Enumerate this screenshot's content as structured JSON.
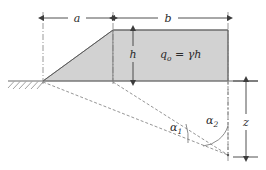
{
  "figure": {
    "labels": {
      "dim_a": "a",
      "dim_b": "b",
      "dim_h": "h",
      "dim_z": "z",
      "load_symbol": "q",
      "load_subscript": "o",
      "load_equation": " = γh",
      "angle_1_symbol": "α",
      "angle_1_subscript": "1",
      "angle_2_symbol": "α",
      "angle_2_subscript": "2"
    },
    "colors": {
      "fill": "#d2d2d2",
      "fill_outline": "#8a8a8a",
      "line": "#5a5a5a",
      "dimension": "#3c3c3c",
      "dashed": "#7a7a7a",
      "dash_dot": "#7d7d7d",
      "text": "#2b2b2b",
      "background": "#ffffff"
    },
    "geometry": {
      "ground_y": 81,
      "crest_y": 30,
      "apex_x": 43,
      "crest_left_x": 113,
      "crest_right_x": 228,
      "point_z_y": 155,
      "ground_left_x": 8,
      "ground_right_x": 258
    },
    "icon_names": {
      "hatching": "ground-hatching-icon",
      "arrow": "dimension-arrow-icon",
      "arc": "angle-arc-icon"
    }
  }
}
